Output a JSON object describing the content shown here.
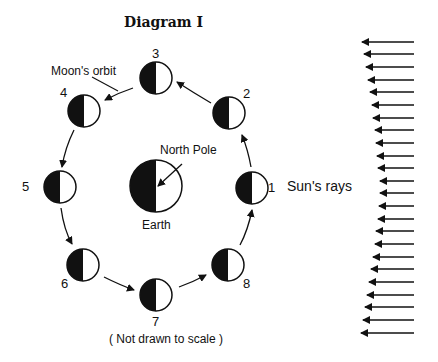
{
  "title": "Diagram I",
  "labels": {
    "moons_orbit": "Moon's orbit",
    "north_pole": "North  Pole",
    "earth": "Earth",
    "suns_rays": "Sun's rays",
    "note": "( Not drawn to scale )"
  },
  "positions": [
    {
      "id": "1",
      "label": "1"
    },
    {
      "id": "2",
      "label": "2"
    },
    {
      "id": "3",
      "label": "3"
    },
    {
      "id": "4",
      "label": "4"
    },
    {
      "id": "5",
      "label": "5"
    },
    {
      "id": "6",
      "label": "6"
    },
    {
      "id": "7",
      "label": "7"
    },
    {
      "id": "8",
      "label": "8"
    }
  ],
  "colors": {
    "ink": "#111111",
    "paper": "#ffffff"
  }
}
